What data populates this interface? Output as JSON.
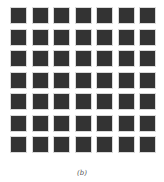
{
  "figure": {
    "caption": "(b)",
    "grid": {
      "rows": 7,
      "cols": 7,
      "cell_color": "#333333",
      "border_color": "#d9d9d9"
    }
  }
}
